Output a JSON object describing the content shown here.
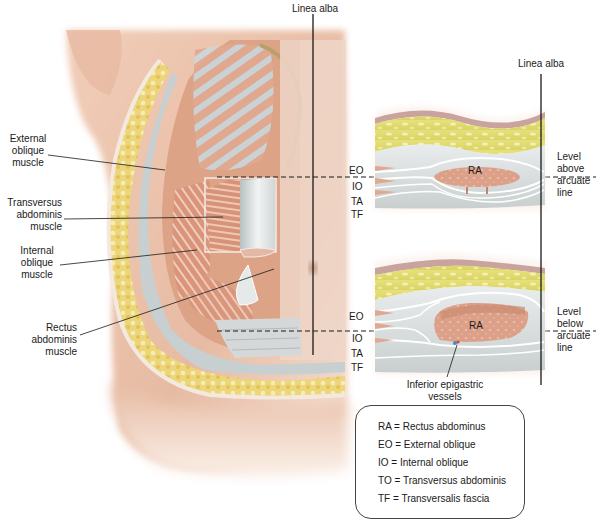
{
  "figure": {
    "type": "anatomical-illustration"
  },
  "main_illustration": {
    "top_label": "Linea alba",
    "callouts": [
      {
        "id": "external-oblique",
        "lines": [
          "External",
          "oblique",
          "muscle"
        ]
      },
      {
        "id": "transversus-abdominis",
        "lines": [
          "Transversus",
          "abdominis",
          "muscle"
        ]
      },
      {
        "id": "internal-oblique",
        "lines": [
          "Internal",
          "oblique",
          "muscle"
        ]
      },
      {
        "id": "rectus-abdominis",
        "lines": [
          "Rectus",
          "abdominis",
          "muscle"
        ]
      }
    ]
  },
  "cross_sections": {
    "top_label": "Linea alba",
    "upper": {
      "layer_labels": [
        "EO",
        "IO",
        "TA",
        "TF"
      ],
      "muscle_label": "RA",
      "level_label": [
        "Level",
        "above",
        "arcuate",
        "line"
      ]
    },
    "lower": {
      "layer_labels": [
        "EO",
        "IO",
        "TA",
        "TF"
      ],
      "muscle_label": "RA",
      "level_label": [
        "Level",
        "below",
        "arcuate",
        "line"
      ],
      "vessel_label": [
        "Inferior epigastric",
        "vessels"
      ]
    }
  },
  "legend": {
    "items": [
      "RA = Rectus abdominus",
      "EO = External oblique",
      "IO = Internal oblique",
      "TO = Transversus abdominis",
      "TF = Transversalis fascia"
    ]
  },
  "colors": {
    "skin": "#e9c3ad",
    "fat": "#e8d76a",
    "muscle": "#d99a80",
    "fascia": "#dfe3e3",
    "fascia_line": "#ffffff",
    "dermis": "#c99a8f",
    "line": "#1a1a1a"
  }
}
